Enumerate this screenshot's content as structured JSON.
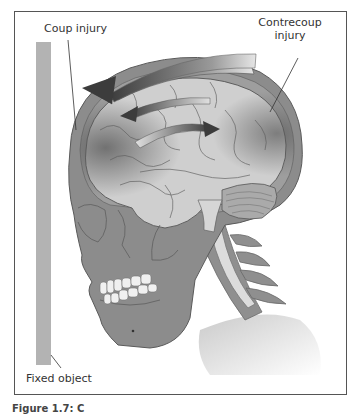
{
  "figure": {
    "labels": {
      "coup": "Coup injury",
      "contrecoup_line1": "Contrecoup",
      "contrecoup_line2": "injury",
      "fixed_object": "Fixed object"
    },
    "caption": "Figure 1.7: C",
    "colors": {
      "frame": "#555555",
      "fixed_object": "#b3b3b3",
      "skull": "#8c8c8c",
      "brain": "#cfcfcf",
      "arrow_dark": "#4a4a4a",
      "background": "#ffffff"
    }
  }
}
